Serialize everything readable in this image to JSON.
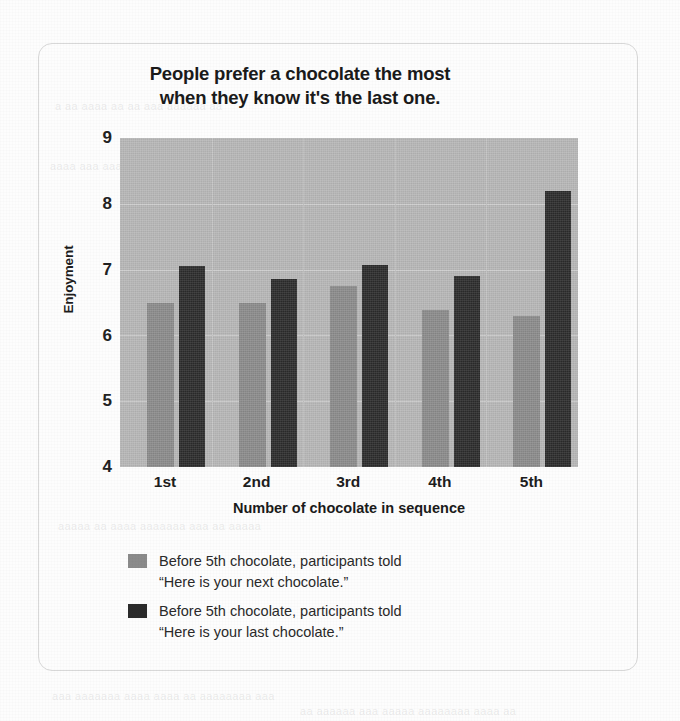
{
  "chart_data": {
    "type": "bar",
    "title": "People prefer a chocolate the most when they know it's the last one.",
    "title_line1": "People prefer a chocolate the most",
    "title_line2": "when they know it's the last one.",
    "xlabel": "Number of chocolate in sequence",
    "ylabel": "Enjoyment",
    "categories": [
      "1st",
      "2nd",
      "3rd",
      "4th",
      "5th"
    ],
    "ylim": [
      4,
      9
    ],
    "yticks": [
      4,
      5,
      6,
      7,
      8,
      9
    ],
    "grid": true,
    "legend_position": "below-plot-left",
    "series": [
      {
        "name": "Before 5th chocolate, participants told \"Here is your next chocolate.\"",
        "name_line1": "Before 5th chocolate, participants told",
        "name_line2": "“Here is your next chocolate.”",
        "color": "#8b8b8b",
        "values": [
          6.5,
          6.5,
          6.75,
          6.38,
          6.3
        ]
      },
      {
        "name": "Before 5th chocolate, participants told \"Here is your last chocolate.\"",
        "name_line1": "Before 5th chocolate, participants told",
        "name_line2": "“Here is your last chocolate.”",
        "color": "#2b2b2b",
        "values": [
          7.05,
          6.85,
          7.07,
          6.9,
          8.2
        ]
      }
    ]
  },
  "ghost_text": {
    "g1": "a aa aaaa aa aa aaa aaaaaa aa",
    "g2": "aaaa aaa aaaaaaaa aa aaaa aaaa aa",
    "g3": "aaaaa aa aaaa aaaaaaa aaa aa aaaaa",
    "g4": "aaa aaaaaaa aaaa aaaa aa aaaaaaaa aaa",
    "g5": "aa aaaaaa aaa aaaaa aaaaaaaa aaaa aa"
  }
}
